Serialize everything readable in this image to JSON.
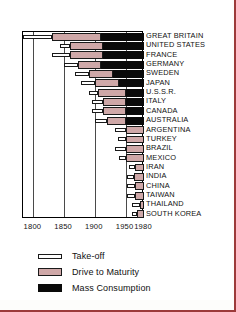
{
  "chart_data": {
    "type": "bar",
    "orientation": "horizontal",
    "title": "",
    "xlabel": "",
    "ylabel": "",
    "xlim": [
      1783,
      1980
    ],
    "xticks": [
      1800,
      1850,
      1900,
      1950,
      1980
    ],
    "xtick_labels": [
      "1800",
      "1850",
      "1900",
      "1950",
      "1980"
    ],
    "grid": true,
    "legend_position": "below",
    "legend": [
      {
        "key": "takeoff",
        "label": "Take-off",
        "color": "#ffffff"
      },
      {
        "key": "drive",
        "label": "Drive to Maturity",
        "color": "#cfa8a8"
      },
      {
        "key": "mass",
        "label": "Mass Consumption",
        "color": "#0a0a0a"
      }
    ],
    "categories": [
      "GREAT BRITAIN",
      "UNITED STATES",
      "FRANCE",
      "GERMANY",
      "SWEDEN",
      "JAPAN",
      "U.S.S.R.",
      "ITALY",
      "CANADA",
      "AUSTRALIA",
      "ARGENTINA",
      "TURKEY",
      "BRAZIL",
      "MEXICO",
      "IRAN",
      "INDIA",
      "CHINA",
      "TAIWAN",
      "THAILAND",
      "SOUTH KOREA"
    ],
    "series": [
      {
        "name": "Take-off",
        "spans": [
          [
            1783,
            1830
          ],
          [
            1843,
            1860
          ],
          [
            1830,
            1860
          ],
          [
            1850,
            1873
          ],
          [
            1868,
            1890
          ],
          [
            1878,
            1900
          ],
          [
            1890,
            1905
          ],
          [
            1895,
            1914
          ],
          [
            1896,
            1914
          ],
          [
            1901,
            1920
          ],
          [
            1933,
            1950
          ],
          [
            1937,
            1950
          ],
          [
            1933,
            1950
          ],
          [
            1940,
            1950
          ],
          [
            1955,
            1965
          ],
          [
            1952,
            1963
          ],
          [
            1952,
            1965
          ],
          [
            1953,
            1965
          ],
          [
            1960,
            1973
          ],
          [
            1961,
            1968
          ]
        ]
      },
      {
        "name": "Drive to Maturity",
        "spans": [
          [
            1830,
            1910
          ],
          [
            1860,
            1914
          ],
          [
            1860,
            1914
          ],
          [
            1873,
            1910
          ],
          [
            1890,
            1930
          ],
          [
            1900,
            1940
          ],
          [
            1905,
            1950
          ],
          [
            1914,
            1950
          ],
          [
            1914,
            1950
          ],
          [
            1920,
            1950
          ],
          [
            1950,
            1980
          ],
          [
            1950,
            1980
          ],
          [
            1950,
            1980
          ],
          [
            1950,
            1980
          ],
          [
            1965,
            1980
          ],
          [
            1963,
            1980
          ],
          [
            1965,
            1980
          ],
          [
            1965,
            1980
          ],
          [
            1973,
            1980
          ],
          [
            1968,
            1980
          ]
        ]
      },
      {
        "name": "Mass Consumption",
        "spans": [
          [
            1910,
            1980
          ],
          [
            1914,
            1980
          ],
          [
            1914,
            1980
          ],
          [
            1910,
            1980
          ],
          [
            1930,
            1980
          ],
          [
            1940,
            1980
          ],
          [
            1950,
            1980
          ],
          [
            1950,
            1980
          ],
          [
            1950,
            1980
          ],
          [
            1950,
            1980
          ],
          null,
          null,
          null,
          null,
          null,
          null,
          null,
          null,
          null,
          null
        ]
      }
    ]
  }
}
